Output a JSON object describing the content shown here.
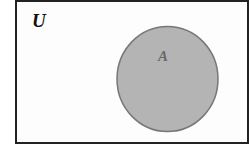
{
  "diagram": {
    "type": "venn",
    "universe_label": "U",
    "sets": [
      {
        "label": "A",
        "fill": "#b4b4b4",
        "stroke": "#707070"
      }
    ],
    "colors": {
      "background": "#ffffff",
      "border": "#222222",
      "label": "#111111",
      "set_label": "#6a6a6a"
    }
  }
}
